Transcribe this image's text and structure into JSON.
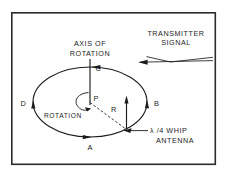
{
  "figure": {
    "background_color": "#ffffff",
    "ink_color": "#1c1c1c",
    "frame_color": "#2b2b2b"
  },
  "labels": {
    "axis_of_rotation_line1": "AXIS OF",
    "axis_of_rotation_line2": "ROTATION",
    "transmitter_line1": "TRANSMITTER",
    "transmitter_line2": "SIGNAL",
    "antenna_line1": "λ /4 WHIP",
    "antenna_line2": "ANTENNA",
    "rotation": "ROTATION",
    "point_a": "A",
    "point_b": "B",
    "point_c": "C",
    "point_d": "D",
    "point_p": "P",
    "radius_r": "R"
  },
  "geometry": {
    "frame": {
      "x": 11,
      "y": 12,
      "width": 205,
      "height": 153
    },
    "orbit": {
      "cx": 90,
      "cy": 102,
      "rx": 57,
      "ry": 35
    },
    "axis": {
      "x": 90,
      "y_top": 45,
      "y_bottom": 105
    },
    "antenna": {
      "x": 126,
      "y_base": 129,
      "y_top": 97
    },
    "radius": {
      "x1": 90,
      "y1": 102,
      "x2": 126,
      "y2": 129
    }
  }
}
